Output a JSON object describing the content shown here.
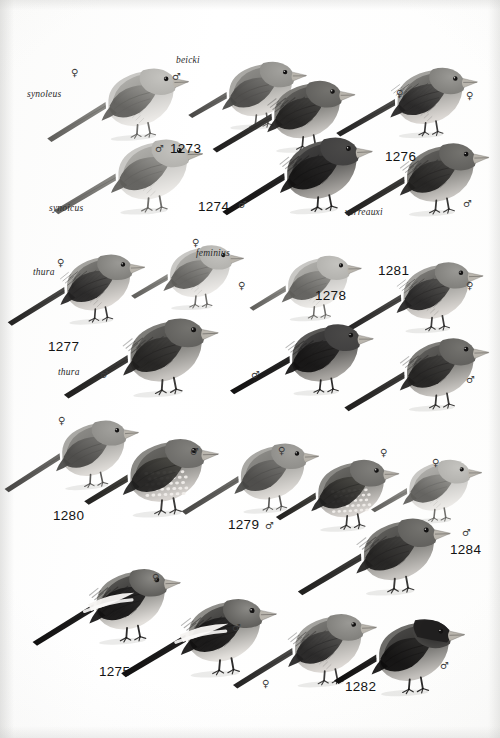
{
  "plate": {
    "kind": "field-guide-illustration-plate",
    "subject": "rosefinches and mountain finches",
    "rendering": "grayscale halftone",
    "background_color": "#fdfdfd",
    "ink_color": "#1d1d1d",
    "width": 500,
    "height": 738
  },
  "symbols": {
    "female": "♀",
    "male": "♂"
  },
  "taxon_labels": [
    {
      "id": "synoleus",
      "text": "synoleus",
      "x": 27,
      "y": 90,
      "italic": true
    },
    {
      "id": "beicki",
      "text": "beicki",
      "x": 176,
      "y": 56,
      "italic": true
    },
    {
      "id": "synoicus",
      "text": "synoicus",
      "x": 49,
      "y": 204,
      "italic": true
    },
    {
      "id": "verreauxi",
      "text": "verreauxi",
      "x": 345,
      "y": 208,
      "italic": true
    },
    {
      "id": "thura-1",
      "text": "thura",
      "x": 33,
      "y": 268,
      "italic": true
    },
    {
      "id": "feminius",
      "text": "feminius",
      "x": 196,
      "y": 249,
      "italic": true
    },
    {
      "id": "thura-2",
      "text": "thura",
      "x": 58,
      "y": 368,
      "italic": true
    }
  ],
  "plate_numbers": [
    {
      "id": "p1273",
      "text": "1273",
      "x": 170,
      "y": 142
    },
    {
      "id": "p1274",
      "text": "1274",
      "x": 198,
      "y": 200
    },
    {
      "id": "p1276",
      "text": "1276",
      "x": 385,
      "y": 150
    },
    {
      "id": "p1277",
      "text": "1277",
      "x": 48,
      "y": 340
    },
    {
      "id": "p1278",
      "text": "1278",
      "x": 315,
      "y": 289
    },
    {
      "id": "p1281",
      "text": "1281",
      "x": 378,
      "y": 264
    },
    {
      "id": "p1280",
      "text": "1280",
      "x": 53,
      "y": 509
    },
    {
      "id": "p1279",
      "text": "1279",
      "x": 228,
      "y": 518
    },
    {
      "id": "p1284",
      "text": "1284",
      "x": 450,
      "y": 543
    },
    {
      "id": "p1275",
      "text": "1275",
      "x": 99,
      "y": 665
    },
    {
      "id": "p1282",
      "text": "1282",
      "x": 345,
      "y": 680
    }
  ],
  "sex_markers": [
    {
      "id": "s01",
      "sex": "female",
      "x": 71,
      "y": 68
    },
    {
      "id": "s02",
      "sex": "male",
      "x": 172,
      "y": 72
    },
    {
      "id": "s03",
      "sex": "female",
      "x": 396,
      "y": 89
    },
    {
      "id": "s04",
      "sex": "female",
      "x": 466,
      "y": 91
    },
    {
      "id": "s05",
      "sex": "male",
      "x": 155,
      "y": 144
    },
    {
      "id": "s06",
      "sex": "male",
      "x": 238,
      "y": 200
    },
    {
      "id": "s07",
      "sex": "male",
      "x": 463,
      "y": 199
    },
    {
      "id": "s08",
      "sex": "female",
      "x": 57,
      "y": 258
    },
    {
      "id": "s09",
      "sex": "female",
      "x": 192,
      "y": 238
    },
    {
      "id": "s10",
      "sex": "female",
      "x": 238,
      "y": 281
    },
    {
      "id": "s11",
      "sex": "female",
      "x": 466,
      "y": 281
    },
    {
      "id": "s12",
      "sex": "male",
      "x": 100,
      "y": 370
    },
    {
      "id": "s13",
      "sex": "male",
      "x": 251,
      "y": 370
    },
    {
      "id": "s14",
      "sex": "male",
      "x": 466,
      "y": 375
    },
    {
      "id": "s15",
      "sex": "female",
      "x": 58,
      "y": 416
    },
    {
      "id": "s16",
      "sex": "male",
      "x": 190,
      "y": 447
    },
    {
      "id": "s17",
      "sex": "female",
      "x": 278,
      "y": 446
    },
    {
      "id": "s18",
      "sex": "female",
      "x": 380,
      "y": 448
    },
    {
      "id": "s19",
      "sex": "female",
      "x": 432,
      "y": 458
    },
    {
      "id": "s20",
      "sex": "male",
      "x": 265,
      "y": 521
    },
    {
      "id": "s21",
      "sex": "male",
      "x": 462,
      "y": 528
    },
    {
      "id": "s22",
      "sex": "female",
      "x": 152,
      "y": 573
    },
    {
      "id": "s23",
      "sex": "male",
      "x": 232,
      "y": 623
    },
    {
      "id": "s24",
      "sex": "female",
      "x": 262,
      "y": 679
    },
    {
      "id": "s25",
      "sex": "male",
      "x": 440,
      "y": 661
    }
  ],
  "birds": [
    {
      "id": "b01",
      "name": "rosefinch-pale-female-upper-left",
      "x": 62,
      "y": 45,
      "w": 132,
      "h": 112,
      "flip": false,
      "rot": -4,
      "tone": "pale",
      "tail": "long",
      "z": 6
    },
    {
      "id": "b02",
      "name": "rosefinch-pale-male-upper-left",
      "x": 70,
      "y": 118,
      "w": 138,
      "h": 110,
      "flip": false,
      "rot": -3,
      "tone": "pale",
      "tail": "long",
      "z": 7
    },
    {
      "id": "b03",
      "name": "rosefinch-beicki-male",
      "x": 185,
      "y": 38,
      "w": 126,
      "h": 108,
      "flip": false,
      "rot": -2,
      "tone": "mid",
      "tail": "short",
      "z": 5
    },
    {
      "id": "b04",
      "name": "rosefinch-streaked-female-1274",
      "x": 228,
      "y": 58,
      "w": 132,
      "h": 110,
      "flip": false,
      "rot": -3,
      "tone": "dark",
      "tail": "long",
      "z": 6
    },
    {
      "id": "b05",
      "name": "rosefinch-dark-male-1274",
      "x": 238,
      "y": 118,
      "w": 140,
      "h": 108,
      "flip": false,
      "rot": -4,
      "tone": "darkest",
      "tail": "long",
      "z": 7
    },
    {
      "id": "b06",
      "name": "rosefinch-streaked-female-1276",
      "x": 352,
      "y": 40,
      "w": 130,
      "h": 118,
      "flip": false,
      "rot": -2,
      "tone": "streaked",
      "tail": "long",
      "z": 5
    },
    {
      "id": "b07",
      "name": "rosefinch-verreauxi-male",
      "x": 360,
      "y": 122,
      "w": 134,
      "h": 108,
      "flip": false,
      "rot": -3,
      "tone": "dark",
      "tail": "long",
      "z": 6
    },
    {
      "id": "b08",
      "name": "rosefinch-thura-female",
      "x": 22,
      "y": 230,
      "w": 128,
      "h": 112,
      "flip": false,
      "rot": -4,
      "tone": "streaked",
      "tail": "long",
      "z": 6
    },
    {
      "id": "b09",
      "name": "rosefinch-feminius-female",
      "x": 128,
      "y": 218,
      "w": 120,
      "h": 112,
      "flip": false,
      "rot": -2,
      "tone": "pale",
      "tail": "short",
      "z": 5
    },
    {
      "id": "b10",
      "name": "rosefinch-thura-male",
      "x": 80,
      "y": 300,
      "w": 144,
      "h": 108,
      "flip": false,
      "rot": -4,
      "tone": "dark",
      "tail": "long",
      "z": 7
    },
    {
      "id": "b11",
      "name": "rosefinch-pale-female-1278",
      "x": 246,
      "y": 230,
      "w": 120,
      "h": 110,
      "flip": false,
      "rot": -3,
      "tone": "pale",
      "tail": "short",
      "z": 5
    },
    {
      "id": "b12",
      "name": "rosefinch-dark-male-1278",
      "x": 246,
      "y": 305,
      "w": 132,
      "h": 102,
      "flip": false,
      "rot": -2,
      "tone": "darkest",
      "tail": "long",
      "z": 6
    },
    {
      "id": "b13",
      "name": "rosefinch-streaked-female-1281",
      "x": 358,
      "y": 238,
      "w": 130,
      "h": 112,
      "flip": false,
      "rot": -3,
      "tone": "streaked",
      "tail": "long",
      "z": 5
    },
    {
      "id": "b14",
      "name": "rosefinch-dark-male-1281",
      "x": 360,
      "y": 318,
      "w": 134,
      "h": 106,
      "flip": false,
      "rot": -3,
      "tone": "dark",
      "tail": "long",
      "z": 6
    },
    {
      "id": "b15",
      "name": "rosefinch-female-1280",
      "x": 18,
      "y": 396,
      "w": 126,
      "h": 112,
      "flip": false,
      "rot": -5,
      "tone": "mid",
      "tail": "long",
      "z": 5
    },
    {
      "id": "b16",
      "name": "rosefinch-spotted-male-1280",
      "x": 80,
      "y": 418,
      "w": 144,
      "h": 112,
      "flip": false,
      "rot": -3,
      "tone": "spotted",
      "tail": "short",
      "z": 6
    },
    {
      "id": "b17",
      "name": "rosefinch-female-1279",
      "x": 196,
      "y": 420,
      "w": 128,
      "h": 110,
      "flip": false,
      "rot": -4,
      "tone": "mid",
      "tail": "long",
      "z": 5
    },
    {
      "id": "b18",
      "name": "rosefinch-spotted-male-1279",
      "x": 272,
      "y": 438,
      "w": 132,
      "h": 108,
      "flip": false,
      "rot": -3,
      "tone": "spotted",
      "tail": "short",
      "z": 6
    },
    {
      "id": "b19",
      "name": "rosefinch-female-1284",
      "x": 368,
      "y": 436,
      "w": 118,
      "h": 104,
      "flip": false,
      "rot": -2,
      "tone": "pale",
      "tail": "short",
      "z": 5
    },
    {
      "id": "b20",
      "name": "rosefinch-male-1284",
      "x": 310,
      "y": 500,
      "w": 150,
      "h": 106,
      "flip": false,
      "rot": -3,
      "tone": "dark",
      "tail": "long",
      "z": 6
    },
    {
      "id": "b21",
      "name": "mountain-finch-female-1275",
      "x": 48,
      "y": 548,
      "w": 138,
      "h": 110,
      "flip": false,
      "rot": -4,
      "tone": "wingbar",
      "tail": "long",
      "z": 5
    },
    {
      "id": "b22",
      "name": "mountain-finch-male-1275",
      "x": 136,
      "y": 580,
      "w": 148,
      "h": 108,
      "flip": false,
      "rot": -3,
      "tone": "wingbar",
      "tail": "long",
      "z": 6
    },
    {
      "id": "b23",
      "name": "rosefinch-female-1282",
      "x": 248,
      "y": 592,
      "w": 134,
      "h": 110,
      "flip": false,
      "rot": -4,
      "tone": "streaked",
      "tail": "long",
      "z": 5
    },
    {
      "id": "b24",
      "name": "rosefinch-blackhead-male-1282",
      "x": 330,
      "y": 598,
      "w": 140,
      "h": 112,
      "flip": false,
      "rot": -3,
      "tone": "blackhead",
      "tail": "short",
      "z": 6
    }
  ]
}
